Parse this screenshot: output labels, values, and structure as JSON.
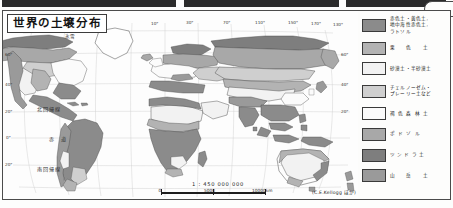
{
  "figure": {
    "title": "世界の土壌分布",
    "credit": "(C.E.Kellogg ほか)",
    "scale_text": "1 : 450 000 000",
    "scale_ticks": [
      "0",
      "5000",
      "10000km"
    ]
  },
  "map": {
    "annotations": [
      {
        "label": "氷雪",
        "x": 62,
        "y": 24,
        "size": "small"
      },
      {
        "label": "北回帰線",
        "x": 36,
        "y": 96,
        "size": "big"
      },
      {
        "label": "赤　道",
        "x": 46,
        "y": 125,
        "size": "big"
      },
      {
        "label": "南回帰線",
        "x": 36,
        "y": 155,
        "size": "big"
      }
    ],
    "longitude_labels": [
      {
        "label": "170°",
        "x": 22,
        "y": 21
      },
      {
        "label": "130°",
        "x": 46,
        "y": 21
      },
      {
        "label": "10°",
        "x": 150,
        "y": 13
      },
      {
        "label": "30°",
        "x": 185,
        "y": 13
      },
      {
        "label": "70°",
        "x": 222,
        "y": 13
      },
      {
        "label": "110°",
        "x": 255,
        "y": 13
      },
      {
        "label": "150°",
        "x": 288,
        "y": 13
      },
      {
        "label": "170°",
        "x": 311,
        "y": 13
      },
      {
        "label": "130°",
        "x": 333,
        "y": 13
      }
    ],
    "latitude_labels": [
      {
        "label": "60°",
        "x": 3,
        "y": 44
      },
      {
        "label": "40°",
        "x": 3,
        "y": 74
      },
      {
        "label": "20°",
        "x": 3,
        "y": 101
      },
      {
        "label": "0°",
        "x": 4,
        "y": 127
      },
      {
        "label": "20°",
        "x": 3,
        "y": 154
      },
      {
        "label": "60°",
        "x": 340,
        "y": 44
      },
      {
        "label": "40°",
        "x": 340,
        "y": 74
      },
      {
        "label": "20°",
        "x": 340,
        "y": 101
      }
    ]
  },
  "legend": {
    "items": [
      {
        "label": "赤色土・黄色土,\n地中海性赤色土,\nラトソル",
        "color": "#8b8b8b",
        "spacing": "none",
        "tall": true
      },
      {
        "label": "栗　色　土",
        "color": "#b3b3b3",
        "spacing": "wide"
      },
      {
        "label": "砂漠土・半砂漠土",
        "color": "#f2f2f2",
        "spacing": "none"
      },
      {
        "label": "チェルノーゼム・\nプレーリー土など",
        "color": "#cfcfcf",
        "spacing": "none"
      },
      {
        "label": "褐色森林土",
        "color": "#fbfbfb",
        "spacing": "wide"
      },
      {
        "label": "ポドゾル",
        "color": "#a8a8a8",
        "spacing": "wide"
      },
      {
        "label": "ツンドラ土",
        "color": "#7e7e7e",
        "spacing": "wide2"
      },
      {
        "label": "山　岳　土",
        "color": "#9a9a9a",
        "spacing": "wide"
      }
    ]
  },
  "colors": {
    "ink": "#2b2b2b",
    "frame": "#4b4b4b",
    "ocean": "#fdfdfd",
    "grid": "#c9c9c9"
  }
}
